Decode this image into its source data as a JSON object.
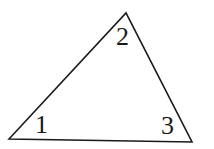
{
  "diagram": {
    "type": "triangle",
    "stroke_color": "#1a1a1a",
    "background": "#ffffff",
    "vertices": [
      {
        "id": "left",
        "x": 9,
        "y": 139
      },
      {
        "id": "top",
        "x": 126,
        "y": 13
      },
      {
        "id": "right",
        "x": 192,
        "y": 142
      }
    ],
    "angle_labels": [
      {
        "text": "1",
        "vertex": "left",
        "x": 35,
        "y": 133
      },
      {
        "text": "2",
        "vertex": "top",
        "x": 116,
        "y": 45
      },
      {
        "text": "3",
        "vertex": "right",
        "x": 161,
        "y": 134
      }
    ]
  }
}
